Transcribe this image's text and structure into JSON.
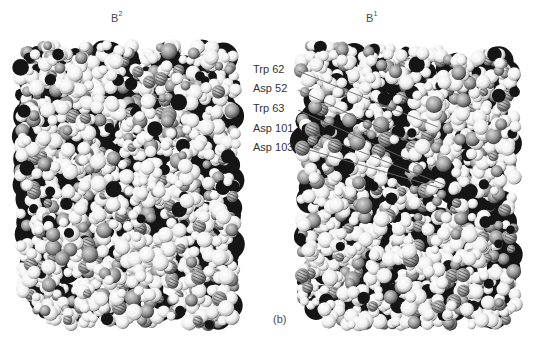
{
  "figure": {
    "type": "space-filling molecular model",
    "panel_label": "(b)",
    "views": [
      {
        "id": "left",
        "label_main": "B",
        "label_sup": "2",
        "label_pos": {
          "x": 111,
          "y": 11
        },
        "center": {
          "x": 128,
          "y": 185
        },
        "radius_x": 108,
        "radius_y": 140
      },
      {
        "id": "right",
        "label_main": "B",
        "label_sup": "1",
        "label_pos": {
          "x": 366,
          "y": 11
        },
        "center": {
          "x": 408,
          "y": 185
        },
        "radius_x": 108,
        "radius_y": 140
      }
    ],
    "residues": [
      {
        "label": "Trp 62",
        "x": 253,
        "y": 63,
        "line_from": {
          "x": 298,
          "y": 71
        },
        "line_to": {
          "x": 438,
          "y": 127
        }
      },
      {
        "label": "Asp 52",
        "x": 253,
        "y": 82,
        "line_from": {
          "x": 298,
          "y": 90
        },
        "line_to": {
          "x": 412,
          "y": 143
        }
      },
      {
        "label": "Trp 63",
        "x": 253,
        "y": 102,
        "line_from": {
          "x": 298,
          "y": 110
        },
        "line_to": {
          "x": 420,
          "y": 165
        }
      },
      {
        "label": "Asp 101",
        "x": 253,
        "y": 122,
        "line_from": {
          "x": 306,
          "y": 130
        },
        "line_to": {
          "x": 445,
          "y": 185
        }
      },
      {
        "label": "Asp 103",
        "x": 253,
        "y": 141,
        "line_from": {
          "x": 306,
          "y": 149
        },
        "line_to": {
          "x": 440,
          "y": 188
        }
      }
    ],
    "colors": {
      "background": "#ffffff",
      "atom_light": "#f4f4f4",
      "atom_mid": "#9a9a9a",
      "atom_dark": "#151515",
      "leader_line": "#6a6a6a"
    }
  }
}
